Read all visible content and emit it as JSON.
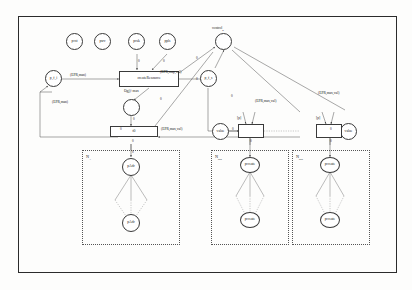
{
  "diagram": {
    "outer_frame": true
  },
  "places": {
    "top_row": [
      {
        "id": "pcst",
        "label": "pcst"
      },
      {
        "id": "psrv",
        "label": "psrv"
      },
      {
        "id": "pcsk",
        "label": "pcsk"
      },
      {
        "id": "ppls",
        "label": "ppls"
      }
    ],
    "control": {
      "label": "control",
      "sub": "n"
    },
    "left_fi": {
      "label": "p_f_i"
    },
    "right_fs": {
      "label": "p_f_s"
    },
    "mid_circle": {
      "label": ""
    },
    "value_left": {
      "label": "value"
    },
    "value_right": {
      "label": "value"
    },
    "subnet_a_top": {
      "label": "pAdr"
    },
    "subnet_a_bottom": {
      "label": "pAdr"
    },
    "subnet_b_top": {
      "label": "pcreate"
    },
    "subnet_b_bottom": {
      "label": "pcreate"
    },
    "subnet_c_top": {
      "label": "pcreate"
    },
    "subnet_c_bottom": {
      "label": "pcreate"
    }
  },
  "transitions": {
    "create_resource": {
      "label": "createResource"
    },
    "lower_main": {
      "label": "t0"
    },
    "mid_right": {
      "label": ""
    },
    "far_right": {
      "label": ""
    }
  },
  "arc_labels": {
    "epr_man_top": "(EPR,man)",
    "epr_man_left": "(EPR,man)",
    "epr_map_cval": "(EPR,map,val)",
    "epr_max_val_mid": "(EPR,max,val)",
    "epr_max_val_right": "(EPR,max,val)",
    "epr_max_val_far": "(EPR,max,val)",
    "obj_res": "Ogj)+max",
    "p_label_mid": "[p]",
    "p_label_right": "[p]"
  },
  "weights": {
    "w1": "0",
    "w2": "0",
    "w3": "0",
    "w4": "0",
    "w5": "0",
    "w6": "0",
    "w7": "0",
    "w8": "0",
    "w9": "0",
    "w10": "0",
    "w11": "0",
    "w12": "0",
    "w13": "0",
    "w14": "0"
  },
  "subnets": [
    {
      "id": "na",
      "label": "N",
      "sub": "A"
    },
    {
      "id": "nsub1",
      "label": "N",
      "sub": "sub"
    },
    {
      "id": "nsub2",
      "label": "N",
      "sub": "sub"
    }
  ],
  "colors": {
    "stroke": "#3c3c3c",
    "text": "#1a1a1a",
    "dashed": "#555555",
    "background": "#fdfdfc"
  }
}
